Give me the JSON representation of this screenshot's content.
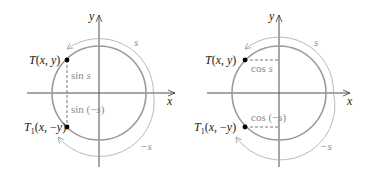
{
  "colors": {
    "axis": "#3a3a3a",
    "circle": "#9a9a9a",
    "arc": "#a8a8a8",
    "dash": "#555555",
    "point": "#000000",
    "label_dark": "#1a1a1a",
    "label_gray": "#8a8a8a"
  },
  "left_diagram": {
    "x_axis_label": "x",
    "y_axis_label": "y",
    "point_T": "T(x, y)",
    "point_T1_T": "T",
    "point_T1_sub": "1",
    "point_T1_rest": "(x, −y)",
    "segment_upper": "sin s",
    "segment_lower": "sin (−s)",
    "arc_upper": "s",
    "arc_lower": "−s"
  },
  "right_diagram": {
    "x_axis_label": "x",
    "y_axis_label": "y",
    "point_T": "T(x, y)",
    "point_T1_T": "T",
    "point_T1_sub": "1",
    "point_T1_rest": "(x, −y)",
    "segment_upper": "cos s",
    "segment_lower": "cos (−s)",
    "arc_upper": "s",
    "arc_lower": "−s"
  }
}
